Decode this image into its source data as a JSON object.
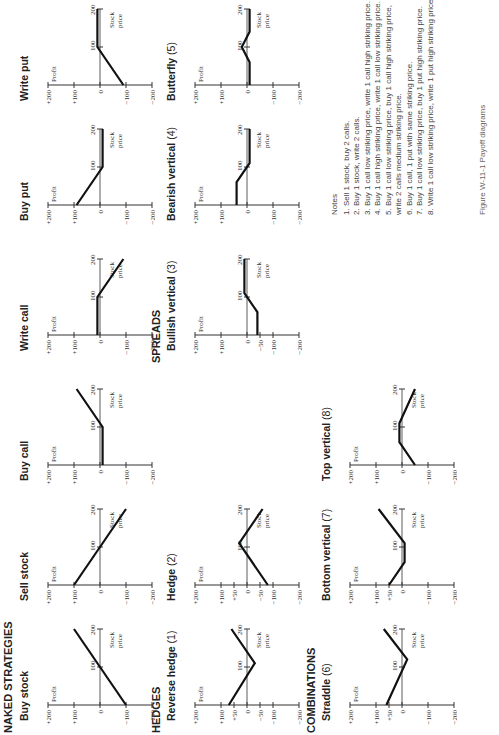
{
  "sections": {
    "naked": "NAKED STRATEGIES",
    "hedges": "HEDGES",
    "spreads": "SPREADS",
    "combinations": "COMBINATIONS"
  },
  "axis": {
    "profit": "Profit",
    "stock": "Stock",
    "price": "price",
    "y_ticks": [
      "+200",
      "+100",
      "0",
      "−100",
      "−200"
    ],
    "x_ticks": [
      "100",
      "200"
    ]
  },
  "panels": [
    {
      "id": "buy-stock",
      "title": "Buy stock",
      "num": "",
      "x": 0,
      "y": 18,
      "ticks": [
        200,
        100,
        0,
        -100,
        -200
      ],
      "pts": [
        [
          0,
          -100
        ],
        [
          200,
          100
        ]
      ]
    },
    {
      "id": "sell-stock",
      "title": "Sell stock",
      "num": "",
      "x": 120,
      "y": 18,
      "ticks": [
        200,
        100,
        0,
        -100,
        -200
      ],
      "pts": [
        [
          0,
          100
        ],
        [
          200,
          -100
        ]
      ]
    },
    {
      "id": "buy-call",
      "title": "Buy call",
      "num": "",
      "x": 240,
      "y": 18,
      "ticks": [
        200,
        100,
        0,
        -100,
        -200
      ],
      "pts": [
        [
          0,
          -10
        ],
        [
          100,
          -10
        ],
        [
          200,
          90
        ]
      ]
    },
    {
      "id": "write-call",
      "title": "Write call",
      "num": "",
      "x": 370,
      "y": 18,
      "ticks": [
        200,
        100,
        0,
        -100,
        -200
      ],
      "pts": [
        [
          0,
          10
        ],
        [
          100,
          10
        ],
        [
          200,
          -90
        ]
      ]
    },
    {
      "id": "buy-put",
      "title": "Buy put",
      "num": "",
      "x": 500,
      "y": 18,
      "ticks": [
        200,
        100,
        0,
        -100,
        -200
      ],
      "pts": [
        [
          0,
          90
        ],
        [
          100,
          -10
        ],
        [
          200,
          -10
        ]
      ]
    },
    {
      "id": "write-put",
      "title": "Write put",
      "num": "",
      "x": 620,
      "y": 18,
      "ticks": [
        200,
        100,
        0,
        -100,
        -200
      ],
      "pts": [
        [
          0,
          -90
        ],
        [
          100,
          10
        ],
        [
          200,
          10
        ]
      ]
    },
    {
      "id": "reverse-hedge",
      "title": "Reverse hedge",
      "num": "(1)",
      "x": 0,
      "y": 165,
      "ticks": [
        200,
        100,
        50,
        0,
        -50,
        -100,
        -200
      ],
      "pts": [
        [
          0,
          70
        ],
        [
          110,
          -30
        ],
        [
          200,
          60
        ]
      ]
    },
    {
      "id": "hedge",
      "title": "Hedge",
      "num": "(2)",
      "x": 120,
      "y": 165,
      "ticks": [
        200,
        100,
        50,
        0,
        -50,
        -100,
        -200
      ],
      "pts": [
        [
          0,
          -80
        ],
        [
          110,
          30
        ],
        [
          200,
          -60
        ]
      ]
    },
    {
      "id": "bullish-vertical",
      "title": "Bullish vertical",
      "num": "(3)",
      "x": 370,
      "y": 165,
      "ticks": [
        200,
        100,
        0,
        -50,
        -100,
        -200
      ],
      "pts": [
        [
          0,
          -40
        ],
        [
          60,
          -40
        ],
        [
          110,
          10
        ],
        [
          200,
          10
        ]
      ]
    },
    {
      "id": "bearish-vertical",
      "title": "Bearish vertical",
      "num": "(4)",
      "x": 500,
      "y": 165,
      "ticks": [
        200,
        100,
        0,
        -100,
        -200
      ],
      "pts": [
        [
          0,
          40
        ],
        [
          60,
          40
        ],
        [
          110,
          -10
        ],
        [
          200,
          -10
        ]
      ]
    },
    {
      "id": "butterfly",
      "title": "Butterfly",
      "num": "(5)",
      "x": 620,
      "y": 165,
      "ticks": [
        200,
        100,
        0,
        -100,
        -200
      ],
      "pts": [
        [
          0,
          -10
        ],
        [
          60,
          -10
        ],
        [
          100,
          20
        ],
        [
          140,
          -10
        ],
        [
          200,
          -10
        ]
      ]
    },
    {
      "id": "straddle",
      "title": "Straddle",
      "num": "(6)",
      "x": 0,
      "y": 320,
      "ticks": [
        200,
        100,
        50,
        0,
        -100,
        -200
      ],
      "pts": [
        [
          0,
          60
        ],
        [
          120,
          -20
        ],
        [
          200,
          70
        ]
      ]
    },
    {
      "id": "bottom-vertical",
      "title": "Bottom vertical",
      "num": "(7)",
      "x": 120,
      "y": 320,
      "ticks": [
        200,
        100,
        50,
        0,
        -100,
        -200
      ],
      "pts": [
        [
          0,
          50
        ],
        [
          60,
          -10
        ],
        [
          110,
          -10
        ],
        [
          200,
          90
        ]
      ]
    },
    {
      "id": "top-vertical",
      "title": "Top vertical",
      "num": "(8)",
      "x": 240,
      "y": 320,
      "ticks": [
        200,
        100,
        0,
        -100,
        -200
      ],
      "pts": [
        [
          0,
          -50
        ],
        [
          60,
          10
        ],
        [
          110,
          10
        ],
        [
          200,
          -50
        ]
      ]
    }
  ],
  "notes": {
    "heading": "Notes",
    "items": [
      "1.  Sell 1 stock, buy 2 calls.",
      "2.  Buy 1 stock, write 2 calls.",
      "3.  Buy 1 call low striking price, write 1 call high striking price.",
      "4.  Buy 1 call high striking price, write 1 call low striking price.",
      "5.  Buy 1 call low striking price, buy 1 call high striking price, write 2 calls medium striking price.",
      "6.  Buy 1 call, 1 put with same striking price.",
      "7.  Buy 1 call low striking price, buy 1 put high striking price.",
      "8.  Write 1 call low striking price, write 1 put high striking price."
    ]
  },
  "caption": "Figure W-11-1  Payoff diagrams"
}
